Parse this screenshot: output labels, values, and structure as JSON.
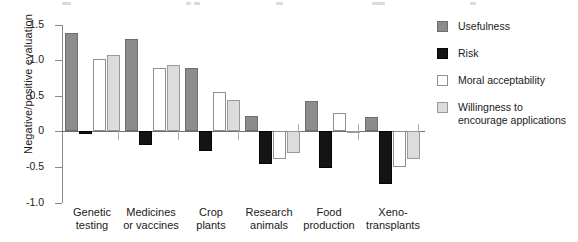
{
  "chart_data": {
    "type": "bar",
    "title": "",
    "xlabel": "",
    "ylabel": "Negative/positive evaluation",
    "ylim": [
      -1.0,
      1.5
    ],
    "yticks": [
      "1.5",
      "1.0",
      "0.5",
      "0",
      "-0.5",
      "-1.0"
    ],
    "ytick_values": [
      1.5,
      1.0,
      0.5,
      0,
      -0.5,
      -1.0
    ],
    "grid": false,
    "legend_position": "right",
    "categories": [
      "Genetic testing",
      "Medicines or vaccines",
      "Crop plants",
      "Research animals",
      "Food production",
      "Xeno-transplants"
    ],
    "category_lines": [
      [
        "Genetic",
        "testing"
      ],
      [
        "Medicines",
        "or vaccines"
      ],
      [
        "Crop",
        "plants"
      ],
      [
        "Research",
        "animals"
      ],
      [
        "Food",
        "production"
      ],
      [
        "Xeno-",
        "transplants"
      ]
    ],
    "series": [
      {
        "name": "Usefulness",
        "color": "#8c8c8c",
        "values": [
          1.38,
          1.29,
          0.88,
          0.21,
          0.42,
          0.19
        ]
      },
      {
        "name": "Risk",
        "color": "#141414",
        "values": [
          -0.04,
          -0.2,
          -0.28,
          -0.46,
          -0.52,
          -0.75
        ]
      },
      {
        "name": "Moral acceptability",
        "color": "#ffffff",
        "values": [
          1.01,
          0.89,
          0.55,
          -0.39,
          0.25,
          -0.5
        ]
      },
      {
        "name": "Willingness to encourage applications",
        "color": "#dcdcdc",
        "values": [
          1.07,
          0.92,
          0.43,
          -0.31,
          -0.01,
          -0.4
        ]
      }
    ]
  },
  "legend": {
    "items": [
      {
        "label": "Usefulness"
      },
      {
        "label": "Risk"
      },
      {
        "label": "Moral acceptability"
      },
      {
        "label": "Willingness to\nencourage applications"
      }
    ]
  },
  "legend_lines": {
    "willingness_line1": "Willingness to",
    "willingness_line2": "encourage applications"
  }
}
